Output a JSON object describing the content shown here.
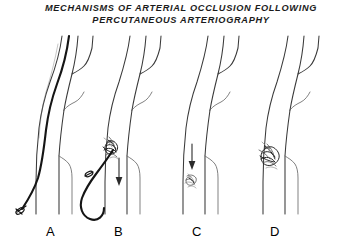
{
  "figure": {
    "title_line_1": "MECHANISMS OF  ARTERIAL  OCCLUSION  FOLLOWING",
    "title_line_2": "PERCUTANEOUS   ARTERIOGRAPHY",
    "background_color": "#ffffff",
    "ink_color": "#3a3a3a",
    "catheter_color": "#151515"
  },
  "panels": [
    {
      "label": "A",
      "name": "catheter-in-artery",
      "has_catheter": true,
      "has_clot": false,
      "has_arrow": false,
      "catheter_state": "indwelling"
    },
    {
      "label": "B",
      "name": "catheter-withdrawal-with-thrombus",
      "has_catheter": true,
      "has_clot": true,
      "has_arrow": true,
      "catheter_state": "withdrawing-looped",
      "clot_position": "puncture-site",
      "clot_shade": "dark"
    },
    {
      "label": "C",
      "name": "embolus-migrating-distally",
      "has_catheter": false,
      "has_clot": true,
      "has_arrow": true,
      "clot_position": "distal-migration",
      "clot_shade": "medium"
    },
    {
      "label": "D",
      "name": "occlusion-at-bifurcation",
      "has_catheter": false,
      "has_clot": true,
      "has_arrow": false,
      "clot_position": "branch-origin",
      "clot_shade": "dark"
    }
  ]
}
